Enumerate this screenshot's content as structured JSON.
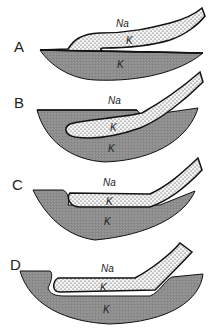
{
  "figure": {
    "colors": {
      "grey_body": "#8d8d8d",
      "stipple_fill": "#f4f4f4",
      "stipple_dots": "#333333",
      "outline": "#111111",
      "background": "#ffffff"
    },
    "panels": [
      {
        "letter": "A",
        "upper_label": "Na",
        "tongue_label": "K",
        "body_label": "K"
      },
      {
        "letter": "B",
        "upper_label": "Na",
        "tongue_label": "K",
        "body_label": "K"
      },
      {
        "letter": "C",
        "upper_label": "Na",
        "tongue_label": "K",
        "body_label": "K"
      },
      {
        "letter": "D",
        "upper_label": "Na",
        "tongue_label": "K",
        "body_label": "K"
      }
    ]
  }
}
